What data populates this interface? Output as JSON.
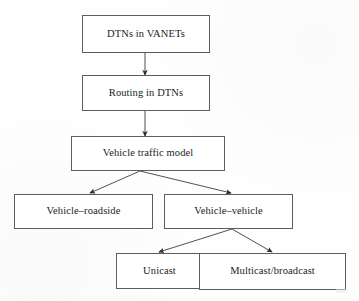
{
  "diagram": {
    "type": "flowchart",
    "title": "",
    "orientation": "top-down",
    "nodes": [
      {
        "id": "dtns-in-vanets",
        "label": "DTNs in VANETs",
        "x": 82,
        "y": 15,
        "w": 128,
        "h": 38,
        "level": 0
      },
      {
        "id": "routing-in-dtns",
        "label": "Routing in DTNs",
        "x": 82,
        "y": 75,
        "w": 128,
        "h": 36,
        "level": 1
      },
      {
        "id": "vehicle-traffic-model",
        "label": "Vehicle traffic model",
        "x": 71,
        "y": 136,
        "w": 154,
        "h": 35,
        "level": 2
      },
      {
        "id": "vehicle-roadside",
        "label": "Vehicle–roadside",
        "x": 14,
        "y": 194,
        "w": 139,
        "h": 35,
        "level": 3
      },
      {
        "id": "vehicle-vehicle",
        "label": "Vehicle–vehicle",
        "x": 164,
        "y": 194,
        "w": 129,
        "h": 35,
        "level": 3
      },
      {
        "id": "unicast",
        "label": "Unicast",
        "x": 116,
        "y": 253,
        "w": 87,
        "h": 36,
        "level": 4
      },
      {
        "id": "multicast-broadcast",
        "label": "Multicast/broadcast",
        "x": 199,
        "y": 253,
        "w": 147,
        "h": 37,
        "level": 4
      }
    ],
    "edges": [
      {
        "id": "edge-vanets-to-routing",
        "from": "dtns-in-vanets",
        "to": "routing-in-dtns",
        "x1": 145,
        "y1": 53,
        "x2": 145,
        "y2": 75,
        "arrow": "filled-triangle"
      },
      {
        "id": "edge-routing-to-traffic",
        "from": "routing-in-dtns",
        "to": "vehicle-traffic-model",
        "x1": 145,
        "y1": 111,
        "x2": 145,
        "y2": 136,
        "arrow": "filled-triangle"
      },
      {
        "id": "edge-traffic-to-roadside",
        "from": "vehicle-traffic-model",
        "to": "vehicle-roadside",
        "x1": 140,
        "y1": 171,
        "x2": 90,
        "y2": 193,
        "arrow": "filled-triangle"
      },
      {
        "id": "edge-traffic-to-vehicle",
        "from": "vehicle-traffic-model",
        "to": "vehicle-vehicle",
        "x1": 140,
        "y1": 171,
        "x2": 231,
        "y2": 193,
        "arrow": "filled-triangle"
      },
      {
        "id": "edge-vehicle-to-unicast",
        "from": "vehicle-vehicle",
        "to": "unicast",
        "x1": 232,
        "y1": 229,
        "x2": 159,
        "y2": 252,
        "arrow": "filled-triangle"
      },
      {
        "id": "edge-vehicle-to-multicast",
        "from": "vehicle-vehicle",
        "to": "multicast-broadcast",
        "x1": 232,
        "y1": 229,
        "x2": 272,
        "y2": 252,
        "arrow": "filled-triangle"
      }
    ],
    "colors": {
      "box_border": "#5d5d5d",
      "box_fill": "#ffffff",
      "line": "#3d3d3d",
      "text": "#232323",
      "page_background": "#fefefe"
    }
  }
}
